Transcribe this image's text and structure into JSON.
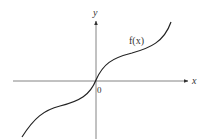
{
  "diagram": {
    "type": "function-graph",
    "axes": {
      "x_label": "x",
      "y_label": "y",
      "origin_label": "0"
    },
    "curve": {
      "label": "f(x)",
      "color": "#222222"
    },
    "colors": {
      "axis": "#555555",
      "text": "#333333",
      "background": "#ffffff"
    }
  }
}
